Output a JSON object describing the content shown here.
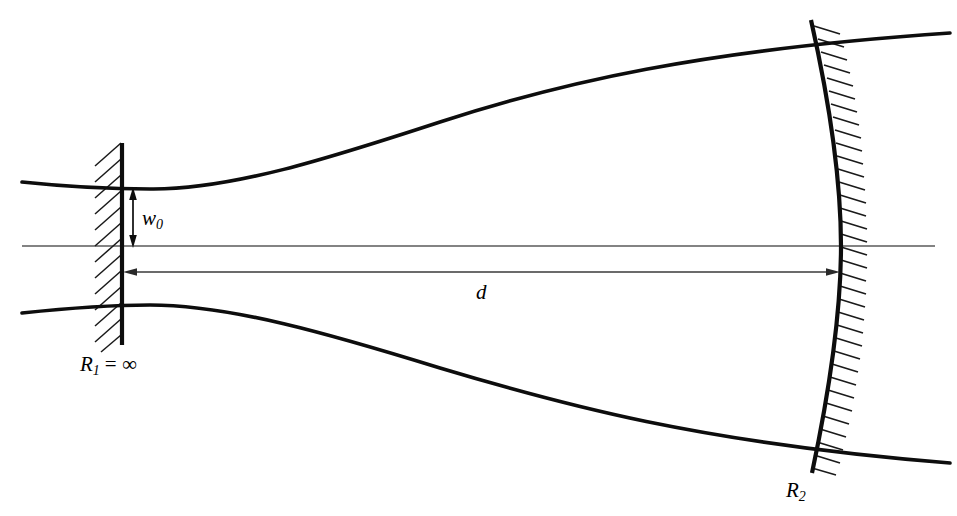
{
  "figure": {
    "background_color": "#ffffff",
    "line_color": "#0d0d0d",
    "axis_color": "#5a5a5a",
    "width": 957,
    "height": 516
  },
  "labels": {
    "waist": {
      "symbol": "w",
      "subscript": "0",
      "full": "w0",
      "x": 142,
      "y": 222
    },
    "separation": {
      "symbol": "d",
      "full": "d",
      "x": 482,
      "y": 296
    },
    "left_mirror": {
      "symbol": "R",
      "subscript": "1",
      "relation": "= ∞",
      "full": "R1 = ∞",
      "x": 82,
      "y": 368
    },
    "right_mirror": {
      "symbol": "R",
      "subscript": "2",
      "full": "R2",
      "x": 788,
      "y": 494
    }
  },
  "elements": {
    "optical_axis": {
      "name": "optical-axis",
      "x1": 22,
      "y1": 246,
      "x2": 935,
      "y2": 246
    },
    "left_mirror": {
      "name": "plane-mirror",
      "curvature": "infinite",
      "x": 122,
      "y_top": 143,
      "y_bottom": 345,
      "hatch_side": "left",
      "hatch_count": 13
    },
    "right_mirror": {
      "name": "concave-mirror",
      "curvature": "finite",
      "vertex_x": 841,
      "vertex_y": 246,
      "x_top": 811,
      "y_top": 20,
      "x_bottom": 812,
      "y_bottom": 473,
      "hatch_side": "right",
      "hatch_count": 34
    },
    "beam_upper": {
      "name": "beam-envelope-upper",
      "x_start": 22,
      "y_start": 182,
      "waist_x": 150,
      "waist_y": 189,
      "x_end": 950,
      "y_end": 33
    },
    "beam_lower": {
      "name": "beam-envelope-lower",
      "x_start": 22,
      "y_start": 313,
      "waist_x": 150,
      "waist_y": 305,
      "x_end": 950,
      "y_end": 463
    },
    "waist_dimension": {
      "name": "waist-dimension-arrow",
      "x": 133,
      "y_top": 189,
      "y_bottom": 246,
      "arrowheads": "both"
    },
    "separation_dimension": {
      "name": "separation-dimension-arrow",
      "y": 272,
      "x_left": 124,
      "x_right": 839,
      "arrowheads": "both"
    }
  }
}
